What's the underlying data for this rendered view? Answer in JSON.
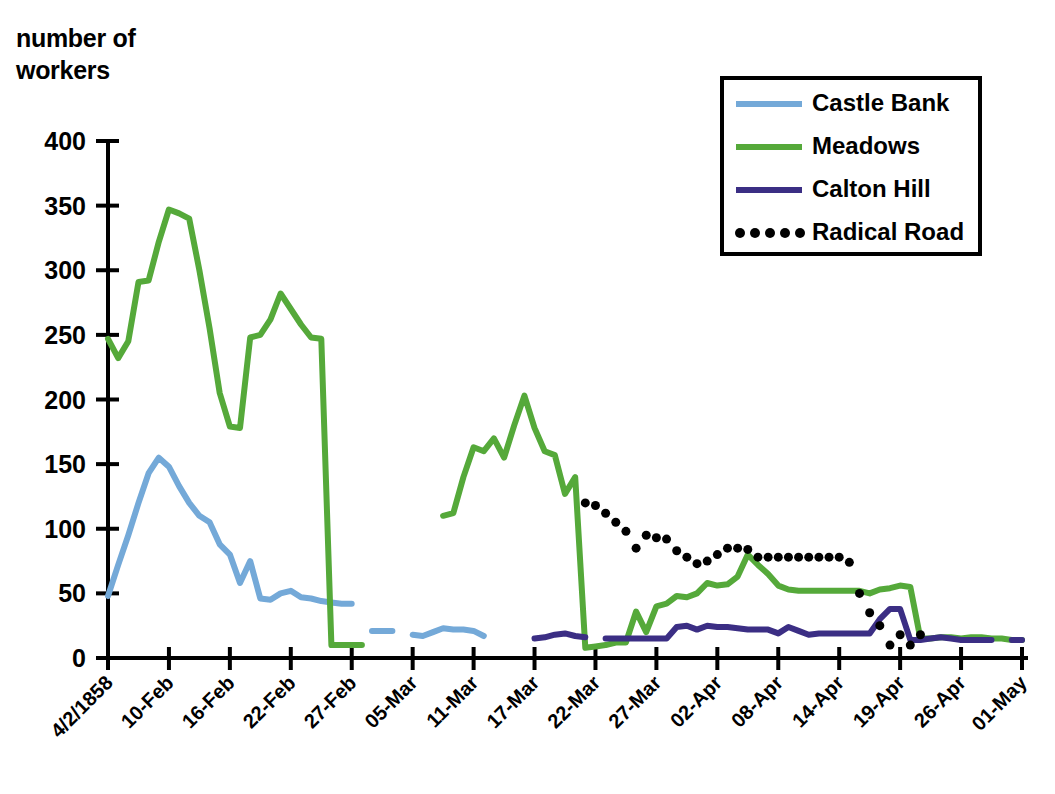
{
  "chart_data": {
    "type": "line",
    "title": "",
    "xlabel": "",
    "ylabel": "number of\nworkers",
    "ylim": [
      0,
      400
    ],
    "yticks": [
      0,
      50,
      100,
      150,
      200,
      250,
      300,
      350,
      400
    ],
    "grid": false,
    "legend_position": "top-right",
    "x_tick_labels": [
      "4/2/1858",
      "10-Feb",
      "16-Feb",
      "22-Feb",
      "27-Feb",
      "05-Mar",
      "11-Mar",
      "17-Mar",
      "22-Mar",
      "27-Mar",
      "02-Apr",
      "08-Apr",
      "14-Apr",
      "19-Apr",
      "26-Apr",
      "01-May"
    ],
    "x_index_range": [
      0,
      90
    ],
    "x_tick_indices": [
      0,
      6,
      12,
      18,
      24,
      30,
      36,
      42,
      48,
      54,
      60,
      66,
      72,
      78,
      84,
      90
    ],
    "series": [
      {
        "name": "Castle Bank",
        "color": "#74A9D8",
        "style": "solid",
        "width": 6,
        "segments": [
          {
            "x": [
              0,
              1,
              2,
              3,
              4,
              5,
              6,
              7,
              8,
              9,
              10,
              11,
              12,
              13,
              14,
              15,
              16,
              17,
              18,
              19,
              20,
              21,
              22,
              23,
              24
            ],
            "y": [
              48,
              72,
              95,
              120,
              143,
              155,
              148,
              133,
              120,
              110,
              105,
              88,
              80,
              58,
              75,
              46,
              45,
              50,
              52,
              47,
              46,
              44,
              43,
              42,
              42
            ]
          },
          {
            "x": [
              26,
              27,
              28
            ],
            "y": [
              21,
              21,
              21
            ]
          },
          {
            "x": [
              30,
              31,
              32,
              33,
              34,
              35,
              36,
              37
            ],
            "y": [
              18,
              17,
              20,
              23,
              22,
              22,
              21,
              17
            ]
          }
        ]
      },
      {
        "name": "Meadows",
        "color": "#55A93A",
        "style": "solid",
        "width": 6,
        "segments": [
          {
            "x": [
              0,
              1,
              2,
              3,
              4,
              5,
              6,
              7,
              8,
              9,
              10,
              11,
              12,
              13,
              14,
              15,
              16,
              17,
              18,
              19,
              20,
              21,
              22,
              23,
              24,
              25
            ],
            "y": [
              247,
              232,
              245,
              291,
              292,
              322,
              347,
              344,
              340,
              300,
              255,
              205,
              179,
              178,
              248,
              250,
              262,
              282,
              270,
              258,
              248,
              247,
              10,
              10,
              10,
              10
            ]
          },
          {
            "x": [
              33,
              34,
              35,
              36,
              37,
              38,
              39,
              40,
              41,
              42,
              43,
              44,
              45,
              46,
              47,
              48,
              49,
              50,
              51,
              52,
              53,
              54,
              55,
              56,
              57,
              58,
              59,
              60,
              61,
              62,
              63,
              64,
              65,
              66,
              67,
              68,
              69,
              70,
              71,
              72,
              73,
              74,
              75,
              76,
              77,
              78,
              79,
              80,
              81,
              82,
              83,
              84,
              85,
              86,
              87,
              88,
              89,
              90
            ],
            "y": [
              110,
              112,
              140,
              163,
              160,
              170,
              155,
              180,
              203,
              178,
              160,
              157,
              127,
              140,
              8,
              9,
              10,
              12,
              12,
              36,
              20,
              40,
              42,
              48,
              47,
              50,
              58,
              56,
              57,
              63,
              80,
              72,
              65,
              56,
              53,
              52,
              52,
              52,
              52,
              52,
              52,
              52,
              50,
              53,
              54,
              56,
              55,
              15,
              15,
              16,
              16,
              15,
              16,
              16,
              15,
              15,
              14,
              14
            ]
          }
        ]
      },
      {
        "name": "Calton Hill",
        "color": "#3B2E84",
        "style": "solid",
        "width": 6,
        "segments": [
          {
            "x": [
              42,
              43,
              44,
              45,
              46,
              47
            ],
            "y": [
              15,
              16,
              18,
              19,
              17,
              16
            ]
          },
          {
            "x": [
              49,
              50,
              51,
              52,
              53,
              54,
              55,
              56,
              57,
              58,
              59,
              60,
              61,
              62,
              63,
              64,
              65,
              66,
              67,
              68,
              69,
              70,
              71,
              72,
              73,
              74,
              75,
              76,
              77,
              78,
              79,
              80,
              81,
              82,
              83,
              84,
              85,
              86,
              87
            ],
            "y": [
              15,
              15,
              15,
              15,
              15,
              15,
              15,
              24,
              25,
              22,
              25,
              24,
              24,
              23,
              22,
              22,
              22,
              19,
              24,
              21,
              18,
              19,
              19,
              19,
              19,
              19,
              19,
              30,
              38,
              38,
              14,
              14,
              15,
              16,
              15,
              14,
              14,
              14,
              14
            ]
          },
          {
            "x": [
              89,
              90
            ],
            "y": [
              14,
              14
            ]
          }
        ]
      },
      {
        "name": "Radical Road",
        "color": "#000000",
        "style": "dotted",
        "width": 9,
        "points": {
          "x": [
            47,
            48,
            49,
            50,
            51,
            52,
            53,
            54,
            55,
            56,
            57,
            58,
            59,
            60,
            61,
            62,
            63,
            64,
            65,
            66,
            67,
            68,
            69,
            70,
            71,
            72,
            73,
            74,
            75,
            76,
            77,
            78,
            79,
            80
          ],
          "y": [
            120,
            118,
            112,
            105,
            98,
            85,
            95,
            93,
            92,
            83,
            78,
            73,
            75,
            80,
            85,
            85,
            84,
            78,
            78,
            78,
            78,
            78,
            78,
            78,
            78,
            78,
            74,
            50,
            35,
            25,
            10,
            18,
            10,
            18
          ]
        }
      }
    ]
  },
  "legend": {
    "items": [
      {
        "label": "Castle Bank",
        "color": "#74A9D8",
        "style": "solid"
      },
      {
        "label": "Meadows",
        "color": "#55A93A",
        "style": "solid"
      },
      {
        "label": "Calton Hill",
        "color": "#3B2E84",
        "style": "solid"
      },
      {
        "label": "Radical Road",
        "color": "#000000",
        "style": "dotted"
      }
    ]
  }
}
